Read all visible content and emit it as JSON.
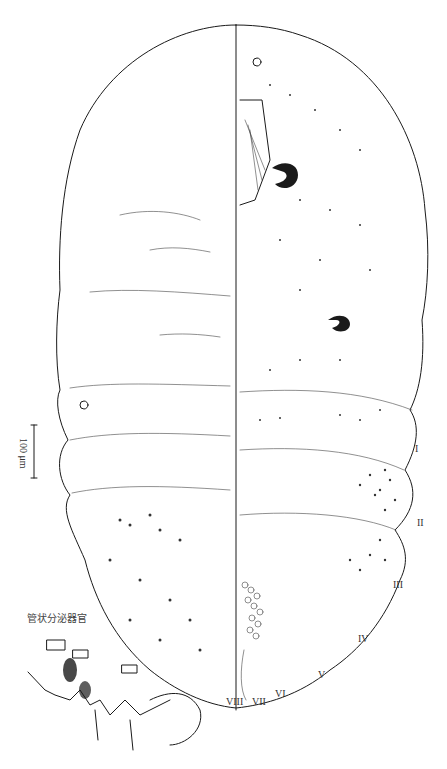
{
  "figure": {
    "scale_bar": {
      "label": "100 μm"
    },
    "inset_caption": "管状分泌器官",
    "segment_labels": [
      "I",
      "II",
      "III",
      "IV",
      "V",
      "VI",
      "VII",
      "VIII"
    ],
    "colors": {
      "line": "#1a1a1a",
      "label": "#333333",
      "background": "#ffffff"
    }
  }
}
